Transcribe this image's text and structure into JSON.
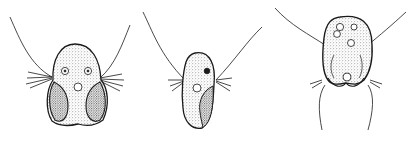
{
  "figure": {
    "panels": [
      {
        "id": "cell-1",
        "view": "ventral view, heart-shaped cell with two lobes, two eyes-like organelles and a central vacuole"
      },
      {
        "id": "cell-2",
        "view": "lateral view, elongated cell with dark spot and vacuole"
      },
      {
        "id": "cell-3",
        "view": "dorsal view, oval cell with several vacuoles and long trailing flagella"
      }
    ],
    "colors": {
      "ink": "#1a1a1a",
      "background": "#ffffff",
      "stipple": "#555555"
    }
  }
}
